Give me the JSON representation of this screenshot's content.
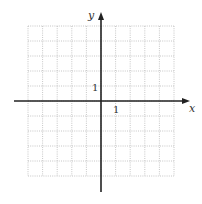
{
  "diagram": {
    "type": "coordinate-grid",
    "grid": {
      "left": 28,
      "top": 26,
      "right": 174,
      "bottom": 176,
      "cols": 10,
      "rows": 10,
      "color": "#b8b8b8"
    },
    "origin": {
      "x": 101,
      "y": 101
    },
    "axis_color": "#222222",
    "x_axis": {
      "label": "x",
      "tick_label": "1",
      "start": 14,
      "end": 190
    },
    "y_axis": {
      "label": "y",
      "tick_label": "1",
      "start": 192,
      "end": 12
    }
  }
}
